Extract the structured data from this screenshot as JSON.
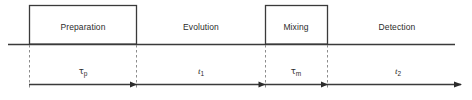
{
  "diagram": {
    "type": "timeline",
    "canvas": {
      "width": 472,
      "height": 100
    },
    "colors": {
      "line": "#3a3a3a",
      "dashed": "#8c8c8c",
      "text": "#2b2b2b",
      "background": "#ffffff"
    },
    "baseline": {
      "y": 44,
      "x_start": 8,
      "x_end": 455
    },
    "arrow_axis": {
      "y": 84,
      "x_start": 29,
      "x_end": 462
    },
    "phases": [
      {
        "id": "preparation",
        "label": "Preparation",
        "boxed": true,
        "box": {
          "x": 29,
          "y": 5,
          "width": 108,
          "height": 39
        },
        "label_x": 83,
        "label_y": 27
      },
      {
        "id": "evolution",
        "label": "Evolution",
        "boxed": false,
        "label_x": 201,
        "label_y": 27
      },
      {
        "id": "mixing",
        "label": "Mixing",
        "boxed": true,
        "box": {
          "x": 265,
          "y": 5,
          "width": 63,
          "height": 39
        },
        "label_x": 296,
        "label_y": 27
      },
      {
        "id": "detection",
        "label": "Detection",
        "boxed": false,
        "label_x": 397,
        "label_y": 27
      }
    ],
    "intervals": [
      {
        "id": "tau-p",
        "symbol": "τ",
        "subscript": "p",
        "text": "τp",
        "x_start": 29,
        "x_end": 137,
        "label_x": 83,
        "label_y": 71
      },
      {
        "id": "t-1",
        "symbol": "t",
        "subscript": "1",
        "text": "t1",
        "x_start": 137,
        "x_end": 265,
        "label_x": 201,
        "label_y": 71
      },
      {
        "id": "tau-m",
        "symbol": "τ",
        "subscript": "m",
        "text": "τm",
        "x_start": 265,
        "x_end": 328,
        "label_x": 296,
        "label_y": 71
      },
      {
        "id": "t-2",
        "symbol": "t",
        "subscript": "2",
        "text": "t2",
        "x_start": 328,
        "x_end": 462,
        "label_x": 398,
        "label_y": 71
      }
    ],
    "dividers": [
      {
        "id": "divider-1",
        "x": 29,
        "y_top": 44,
        "y_bottom": 88
      },
      {
        "id": "divider-2",
        "x": 137,
        "y_top": 44,
        "y_bottom": 88
      },
      {
        "id": "divider-3",
        "x": 265,
        "y_top": 44,
        "y_bottom": 88
      },
      {
        "id": "divider-4",
        "x": 328,
        "y_top": 44,
        "y_bottom": 88
      }
    ],
    "arrowheads": [
      {
        "id": "arrowhead-tau-p",
        "x": 137,
        "y": 84
      },
      {
        "id": "arrowhead-t-1",
        "x": 265,
        "y": 84
      },
      {
        "id": "arrowhead-tau-m",
        "x": 328,
        "y": 84
      },
      {
        "id": "arrowhead-t-2",
        "x": 462,
        "y": 84
      }
    ]
  }
}
